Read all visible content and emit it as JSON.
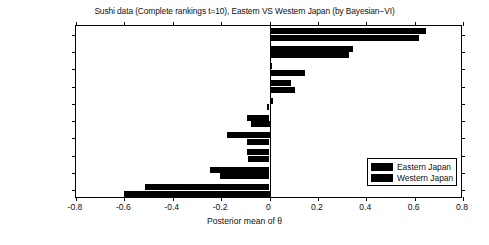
{
  "chart_data": {
    "type": "bar",
    "orientation": "horizontal",
    "title": "Sushi data (Complete rankings t=10), Eastern VS Western Japan (by Bayesian−VI)",
    "xlabel": "Posterior mean of θ",
    "ylabel": "",
    "xlim": [
      -0.8,
      0.8
    ],
    "xticks": [
      -0.8,
      -0.6,
      -0.4,
      -0.2,
      0,
      0.2,
      0.4,
      0.6,
      0.8
    ],
    "xtick_labels": [
      "-0.8",
      "-0.6",
      "-0.4",
      "-0.2",
      "0",
      "0.2",
      "0.4",
      "0.6",
      "0.8"
    ],
    "grid": false,
    "legend_position": "lower right",
    "categories": [
      "Cucumber",
      "Egg",
      "Squid",
      "Tuna roll",
      "Sea urchin",
      "Sea eel",
      "Shrimp",
      "Salmon roe",
      "Tuna",
      "Fatty tuna"
    ],
    "series": [
      {
        "name": "Eastern Japan",
        "color": "#000000",
        "values": [
          0.645,
          0.345,
          0.012,
          0.088,
          0.015,
          -0.095,
          -0.175,
          -0.092,
          -0.245,
          -0.515
        ]
      },
      {
        "name": "Western Japan",
        "color": "#000000",
        "values": [
          0.62,
          0.33,
          0.148,
          0.105,
          -0.012,
          -0.075,
          -0.095,
          -0.09,
          -0.205,
          -0.6
        ]
      }
    ]
  },
  "legend": {
    "entries": [
      {
        "label": "Eastern Japan"
      },
      {
        "label": "Western Japan"
      }
    ]
  },
  "figure": {
    "window_title": "Sushi data (Complete rankings t=10), Eastern VS Western Japan (by Bayesian−VI)"
  }
}
